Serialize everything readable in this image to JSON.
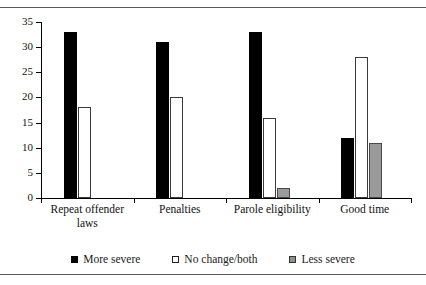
{
  "chart_data": {
    "type": "bar",
    "title": "",
    "subtitle": "",
    "xlabel": "",
    "ylabel": "",
    "ylim": [
      0,
      35
    ],
    "yticks": [
      0,
      5,
      10,
      15,
      20,
      25,
      30,
      35
    ],
    "grid": false,
    "legend_position": "bottom",
    "categories": [
      "Repeat offender laws",
      "Penalties",
      "Parole eligibility",
      "Good time"
    ],
    "category_lines": [
      [
        "Repeat offender",
        "laws"
      ],
      [
        "Penalties"
      ],
      [
        "Parole eligibility"
      ],
      [
        "Good time"
      ]
    ],
    "series": [
      {
        "name": "More severe",
        "fill": "#000000",
        "values": [
          33,
          31,
          33,
          12
        ]
      },
      {
        "name": "No change/both",
        "fill": "#ffffff",
        "values": [
          18,
          20,
          16,
          28
        ]
      },
      {
        "name": "Less severe",
        "fill": "#9a9a9a",
        "values": [
          0,
          0,
          2,
          11
        ]
      }
    ]
  },
  "legend": {
    "items": [
      {
        "label": "More severe",
        "style": "more"
      },
      {
        "label": "No change/both",
        "style": "nochange"
      },
      {
        "label": "Less severe",
        "style": "less"
      }
    ]
  },
  "axis": {
    "y_tick_labels": [
      "35",
      "30",
      "25",
      "20",
      "15",
      "10",
      "5",
      "0"
    ]
  }
}
